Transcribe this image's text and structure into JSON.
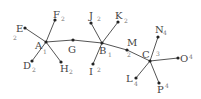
{
  "diagram": {
    "type": "tree-graph",
    "colors": {
      "edge": "#555555",
      "node": "#222222",
      "label": "#444444",
      "subscript": "#777777"
    },
    "nodes": [
      {
        "id": "A",
        "label": "A",
        "sub": "1",
        "x": 46,
        "y": 42,
        "lx": 35,
        "ly": 49,
        "sx": 43,
        "sy": 54
      },
      {
        "id": "B",
        "label": "B",
        "sub": "1",
        "x": 102,
        "y": 43,
        "lx": 99,
        "ly": 54,
        "sx": 108,
        "sy": 57
      },
      {
        "id": "C",
        "label": "C",
        "sub": "3",
        "x": 150,
        "y": 61,
        "lx": 142,
        "ly": 58,
        "sx": 156,
        "sy": 56
      },
      {
        "id": "D",
        "label": "D",
        "sub": "2",
        "x": 32,
        "y": 61,
        "lx": 23,
        "ly": 69,
        "sx": 32,
        "sy": 72
      },
      {
        "id": "E",
        "label": "E",
        "sub": "2",
        "x": 25,
        "y": 28,
        "lx": 16,
        "ly": 32,
        "sx": 13,
        "sy": 40
      },
      {
        "id": "F",
        "label": "F",
        "sub": "2",
        "x": 55,
        "y": 20,
        "lx": 53,
        "ly": 18,
        "sx": 61,
        "sy": 21
      },
      {
        "id": "G",
        "label": "G",
        "sub": "",
        "x": 73,
        "y": 40,
        "lx": 68,
        "ly": 53,
        "sx": 0,
        "sy": 0
      },
      {
        "id": "H",
        "label": "H",
        "sub": "2",
        "x": 61,
        "y": 62,
        "lx": 60,
        "ly": 72,
        "sx": 69,
        "sy": 74
      },
      {
        "id": "I",
        "label": "I",
        "sub": "2",
        "x": 93,
        "y": 64,
        "lx": 89,
        "ly": 75,
        "sx": 97,
        "sy": 72
      },
      {
        "id": "J",
        "label": "J",
        "sub": "2",
        "x": 91,
        "y": 23,
        "lx": 89,
        "ly": 19,
        "sx": 97,
        "sy": 21
      },
      {
        "id": "K",
        "label": "K",
        "sub": "2",
        "x": 118,
        "y": 22,
        "lx": 115,
        "ly": 19,
        "sx": 124,
        "sy": 23
      },
      {
        "id": "L",
        "label": "L",
        "sub": "4",
        "x": 136,
        "y": 78,
        "lx": 126,
        "ly": 82,
        "sx": 134,
        "sy": 86
      },
      {
        "id": "M",
        "label": "M",
        "sub": "2",
        "x": 127,
        "y": 50,
        "lx": 127,
        "ly": 46,
        "sx": 127,
        "sy": 57
      },
      {
        "id": "N",
        "label": "N",
        "sub": "4",
        "x": 158,
        "y": 37,
        "lx": 155,
        "ly": 33,
        "sx": 163,
        "sy": 35
      },
      {
        "id": "O",
        "label": "O",
        "sub": "4",
        "x": 178,
        "y": 58,
        "lx": 180,
        "ly": 62,
        "sx": 189,
        "sy": 59
      },
      {
        "id": "P",
        "label": "P",
        "sub": "4",
        "x": 159,
        "y": 83,
        "lx": 157,
        "ly": 93,
        "sx": 165,
        "sy": 88
      }
    ],
    "edges": [
      [
        "A",
        "E"
      ],
      [
        "A",
        "F"
      ],
      [
        "A",
        "D"
      ],
      [
        "A",
        "H"
      ],
      [
        "A",
        "G"
      ],
      [
        "G",
        "B"
      ],
      [
        "B",
        "J"
      ],
      [
        "B",
        "K"
      ],
      [
        "B",
        "I"
      ],
      [
        "B",
        "M"
      ],
      [
        "M",
        "C"
      ],
      [
        "C",
        "N"
      ],
      [
        "C",
        "O"
      ],
      [
        "C",
        "L"
      ],
      [
        "C",
        "P"
      ]
    ]
  }
}
